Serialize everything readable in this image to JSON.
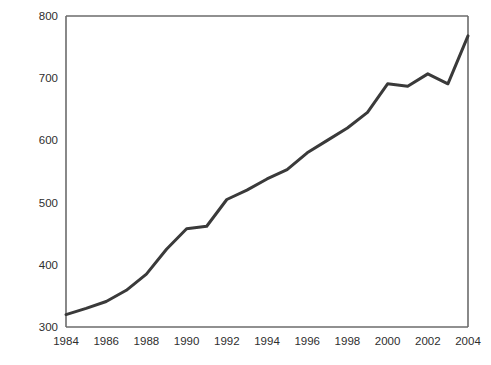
{
  "chart_data": {
    "type": "line",
    "title": "",
    "xlabel": "",
    "ylabel": "Millions of arrivals",
    "xlim": [
      1984,
      2004
    ],
    "ylim": [
      300,
      800
    ],
    "grid": false,
    "legend": null,
    "x_ticks": [
      "1984",
      "1986",
      "1988",
      "1990",
      "1992",
      "1994",
      "1996",
      "1998",
      "2000",
      "2002",
      "2004"
    ],
    "y_ticks": [
      "300",
      "400",
      "500",
      "600",
      "700",
      "800"
    ],
    "x": [
      1984,
      1985,
      1986,
      1987,
      1988,
      1989,
      1990,
      1991,
      1992,
      1993,
      1994,
      1995,
      1996,
      1997,
      1998,
      1999,
      2000,
      2001,
      2002,
      2003,
      2004
    ],
    "values": [
      320,
      330,
      341,
      359,
      385,
      425,
      458,
      462,
      505,
      520,
      538,
      553,
      580,
      600,
      620,
      645,
      691,
      687,
      707,
      691,
      768
    ],
    "series": [
      {
        "name": "International tourist arrivals",
        "values": [
          320,
          330,
          341,
          359,
          385,
          425,
          458,
          462,
          505,
          520,
          538,
          553,
          580,
          600,
          620,
          645,
          691,
          687,
          707,
          691,
          768
        ]
      }
    ],
    "line_color": "#3a3a3a",
    "line_width": 3,
    "axis_color": "#6b6b6b",
    "background": "#ffffff"
  }
}
